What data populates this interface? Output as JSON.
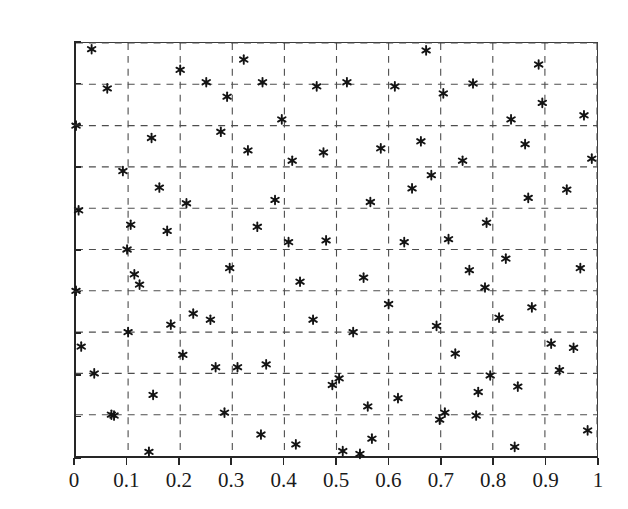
{
  "figure": {
    "title": "",
    "background_color": "#ffffff",
    "axis_color": "#262626",
    "grid_color": "#4d4d4d",
    "marker_color": "#141414"
  },
  "axes": {
    "x_ticks": [
      "0",
      "0.1",
      "0.2",
      "0.3",
      "0.4",
      "0.5",
      "0.6",
      "0.7",
      "0.8",
      "0.9",
      "1"
    ],
    "y_ticks": [
      "0",
      "0.1",
      "0.2",
      "0.3",
      "0.4",
      "0.5",
      "0.6",
      "0.7",
      "0.8",
      "0.9",
      "1"
    ],
    "x_label": "",
    "y_label": ""
  },
  "chart_data": {
    "type": "scatter",
    "title": "",
    "xlabel": "",
    "ylabel": "",
    "xlim": [
      0,
      1
    ],
    "ylim": [
      0,
      1
    ],
    "xticks": [
      0,
      0.1,
      0.2,
      0.3,
      0.4,
      0.5,
      0.6,
      0.7,
      0.8,
      0.9,
      1
    ],
    "yticks": [
      0,
      0.1,
      0.2,
      0.3,
      0.4,
      0.5,
      0.6,
      0.7,
      0.8,
      0.9,
      1
    ],
    "grid": true,
    "grid_style": "dashed",
    "legend": false,
    "marker": "asterisk",
    "marker_size": 9,
    "series": [
      {
        "name": "points",
        "points": [
          [
            0.0,
            0.8
          ],
          [
            0.0,
            0.4
          ],
          [
            0.005,
            0.595
          ],
          [
            0.01,
            0.265
          ],
          [
            0.03,
            0.985
          ],
          [
            0.035,
            0.2
          ],
          [
            0.06,
            0.89
          ],
          [
            0.068,
            0.1
          ],
          [
            0.073,
            0.098
          ],
          [
            0.09,
            0.69
          ],
          [
            0.098,
            0.5
          ],
          [
            0.1,
            0.3
          ],
          [
            0.105,
            0.56
          ],
          [
            0.112,
            0.44
          ],
          [
            0.122,
            0.415
          ],
          [
            0.14,
            0.01
          ],
          [
            0.145,
            0.77
          ],
          [
            0.148,
            0.148
          ],
          [
            0.16,
            0.65
          ],
          [
            0.175,
            0.545
          ],
          [
            0.182,
            0.318
          ],
          [
            0.2,
            0.935
          ],
          [
            0.205,
            0.245
          ],
          [
            0.212,
            0.612
          ],
          [
            0.225,
            0.345
          ],
          [
            0.25,
            0.905
          ],
          [
            0.258,
            0.33
          ],
          [
            0.268,
            0.215
          ],
          [
            0.278,
            0.785
          ],
          [
            0.285,
            0.105
          ],
          [
            0.29,
            0.87
          ],
          [
            0.295,
            0.455
          ],
          [
            0.31,
            0.215
          ],
          [
            0.322,
            0.96
          ],
          [
            0.33,
            0.74
          ],
          [
            0.348,
            0.555
          ],
          [
            0.355,
            0.052
          ],
          [
            0.358,
            0.905
          ],
          [
            0.365,
            0.222
          ],
          [
            0.382,
            0.62
          ],
          [
            0.395,
            0.815
          ],
          [
            0.408,
            0.518
          ],
          [
            0.415,
            0.715
          ],
          [
            0.422,
            0.028
          ],
          [
            0.43,
            0.422
          ],
          [
            0.455,
            0.33
          ],
          [
            0.462,
            0.895
          ],
          [
            0.475,
            0.735
          ],
          [
            0.48,
            0.522
          ],
          [
            0.492,
            0.172
          ],
          [
            0.505,
            0.188
          ],
          [
            0.512,
            0.012
          ],
          [
            0.52,
            0.905
          ],
          [
            0.532,
            0.3
          ],
          [
            0.545,
            0.005
          ],
          [
            0.552,
            0.432
          ],
          [
            0.56,
            0.12
          ],
          [
            0.565,
            0.615
          ],
          [
            0.568,
            0.042
          ],
          [
            0.585,
            0.745
          ],
          [
            0.6,
            0.368
          ],
          [
            0.612,
            0.895
          ],
          [
            0.618,
            0.14
          ],
          [
            0.63,
            0.518
          ],
          [
            0.645,
            0.648
          ],
          [
            0.662,
            0.762
          ],
          [
            0.672,
            0.982
          ],
          [
            0.682,
            0.68
          ],
          [
            0.692,
            0.315
          ],
          [
            0.698,
            0.088
          ],
          [
            0.705,
            0.878
          ],
          [
            0.708,
            0.105
          ],
          [
            0.715,
            0.525
          ],
          [
            0.728,
            0.248
          ],
          [
            0.742,
            0.715
          ],
          [
            0.755,
            0.45
          ],
          [
            0.762,
            0.902
          ],
          [
            0.768,
            0.098
          ],
          [
            0.772,
            0.155
          ],
          [
            0.785,
            0.408
          ],
          [
            0.788,
            0.565
          ],
          [
            0.795,
            0.195
          ],
          [
            0.812,
            0.335
          ],
          [
            0.825,
            0.478
          ],
          [
            0.835,
            0.815
          ],
          [
            0.842,
            0.022
          ],
          [
            0.848,
            0.168
          ],
          [
            0.862,
            0.755
          ],
          [
            0.868,
            0.625
          ],
          [
            0.875,
            0.36
          ],
          [
            0.888,
            0.948
          ],
          [
            0.895,
            0.855
          ],
          [
            0.912,
            0.272
          ],
          [
            0.928,
            0.208
          ],
          [
            0.942,
            0.645
          ],
          [
            0.955,
            0.262
          ],
          [
            0.968,
            0.455
          ],
          [
            0.975,
            0.825
          ],
          [
            0.982,
            0.062
          ],
          [
            0.99,
            0.72
          ]
        ]
      }
    ],
    "n_points": 100
  }
}
